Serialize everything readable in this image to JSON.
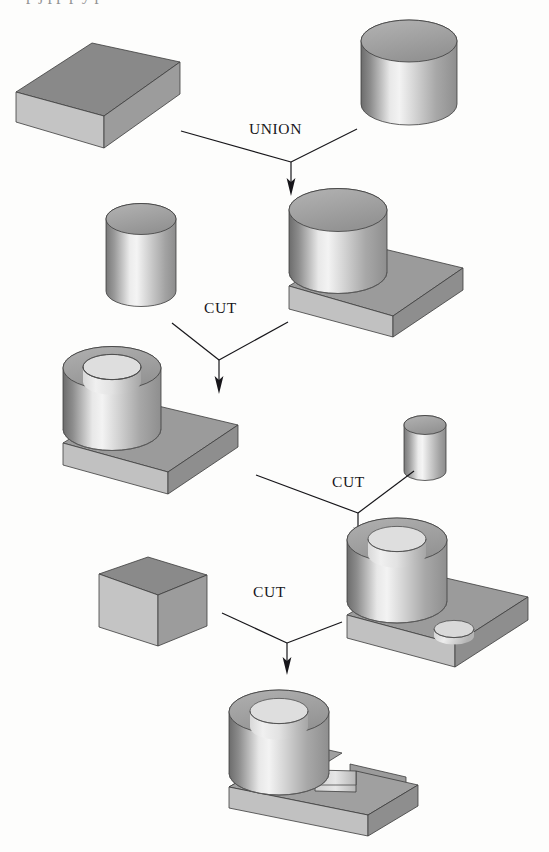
{
  "figure": {
    "background_color": "#fdfdfc",
    "ink_color": "#17161a",
    "top_bleed_text": "p j pp p y p"
  },
  "operations": [
    {
      "id": "op-union",
      "label": "UNION",
      "x": 249,
      "y": 128,
      "result_step": 2
    },
    {
      "id": "op-cut-1",
      "label": "CUT",
      "x": 204,
      "y": 308,
      "result_step": 4
    },
    {
      "id": "op-cut-2",
      "label": "CUT",
      "x": 332,
      "y": 482,
      "result_step": 6
    },
    {
      "id": "op-cut-3",
      "label": "CUT",
      "x": 253,
      "y": 592,
      "result_step": 8
    }
  ],
  "shapes": [
    {
      "id": "shape-block-base",
      "name": "rectangular block",
      "role": "operand",
      "row": 1
    },
    {
      "id": "shape-cylinder-large",
      "name": "large cylinder",
      "role": "operand",
      "row": 1
    },
    {
      "id": "shape-cylinder-inner",
      "name": "medium cylinder",
      "role": "operand",
      "row": 2
    },
    {
      "id": "shape-union-result",
      "name": "cylinder on plate (union)",
      "role": "result",
      "row": 2
    },
    {
      "id": "shape-ring-plate",
      "name": "ring on plate",
      "role": "result",
      "row": 3
    },
    {
      "id": "shape-cylinder-small",
      "name": "small cylinder",
      "role": "operand",
      "row": 3
    },
    {
      "id": "shape-block-cutter",
      "name": "rectangular cutter block",
      "role": "operand",
      "row": 4
    },
    {
      "id": "shape-ring-plate-hole",
      "name": "ring on plate with hole",
      "role": "result",
      "row": 4
    },
    {
      "id": "shape-final-part",
      "name": "finished slotted bracket",
      "role": "result",
      "row": 5
    }
  ],
  "palette": {
    "top_face_dark": "#8a8a8a",
    "top_face_mid": "#a3a3a3",
    "side_light": "#c6c6c6",
    "side_mid": "#9d9d9d",
    "side_dark": "#6f6f6f",
    "highlight": "#f2f2f2",
    "outline": "#3c3c3c"
  }
}
